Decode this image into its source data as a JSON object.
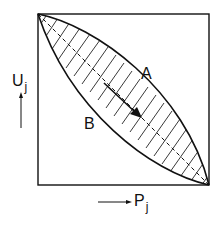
{
  "diagram": {
    "y_axis": {
      "label": "U",
      "subscript": "j",
      "arrow": "up"
    },
    "x_axis": {
      "label": "P",
      "subscript": "j",
      "arrow": "right"
    },
    "curves": [
      {
        "name": "A",
        "description": "upper convex curve from top-left to bottom-right"
      },
      {
        "name": "B",
        "description": "lower concave curve from top-left to bottom-right"
      }
    ],
    "diagonal": "dashed line from top-left to bottom-right",
    "region": "hatched area between curves A and B",
    "arrow": "bold arrow pointing from curve B toward curve A direction (down-right)",
    "colors": {
      "line": "#111111",
      "background": "#ffffff"
    }
  }
}
